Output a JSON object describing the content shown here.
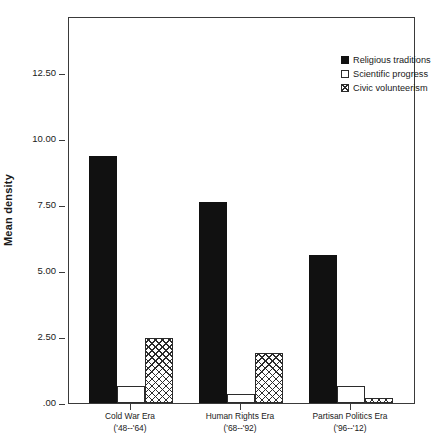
{
  "chart_data": {
    "type": "bar",
    "title": "",
    "xlabel": "",
    "ylabel": "Mean density",
    "ylim": [
      0,
      13.9
    ],
    "grid": false,
    "legend_position": "top-right",
    "categories": [
      "Cold War Era",
      "Human Rights Era",
      "Partisan Politics Era"
    ],
    "category_sublabels": [
      "('48--'64)",
      "('68--'92)",
      "('96--'12)"
    ],
    "ytick_labels": [
      ".00",
      "2.50",
      "5.00",
      "7.50",
      "10.00",
      "12.50"
    ],
    "ytick_values": [
      0,
      2.5,
      5.0,
      7.5,
      10.0,
      12.5
    ],
    "series": [
      {
        "name": "Religious traditions",
        "fill": "solid",
        "values": [
          9.35,
          7.62,
          5.62
        ]
      },
      {
        "name": "Scientific progress",
        "fill": "open",
        "values": [
          0.64,
          0.36,
          0.64
        ]
      },
      {
        "name": "Civic volunteerism",
        "fill": "crosshatch",
        "values": [
          2.46,
          1.9,
          0.2
        ]
      }
    ]
  }
}
